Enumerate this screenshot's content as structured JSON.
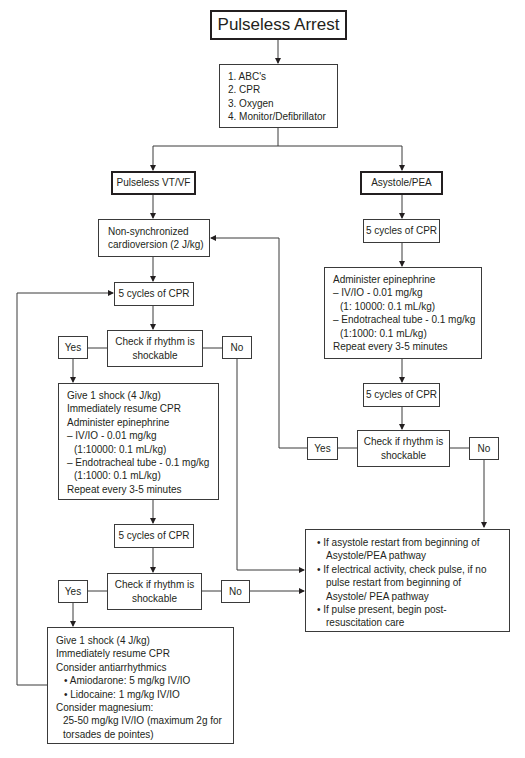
{
  "title": "Pulseless Arrest",
  "initial_steps": [
    "1. ABC's",
    "2. CPR",
    "3. Oxygen",
    "4. Monitor/Defibrillator"
  ],
  "branches": {
    "left": {
      "label": "Pulseless VT/VF",
      "cardioversion": [
        "Non-synchronized",
        "cardioversion (2 J/kg)"
      ],
      "cpr1": "5 cycles of CPR",
      "check1": [
        "Check if rhythm is",
        "shockable"
      ],
      "yes1": "Yes",
      "no1": "No",
      "shock1": {
        "lines": [
          "Give 1 shock (4 J/kg)",
          "Immediately resume CPR",
          "Administer epinephrine",
          "– IV/IO - 0.01 mg/kg",
          "(1:10000: 0.1 mL/kg)",
          "– Endotracheal tube - 0.1 mg/kg",
          "(1:1000: 0.1 mL/kg)",
          "Repeat every 3-5 minutes"
        ]
      },
      "cpr2": "5 cycles of CPR",
      "check2": [
        "Check if rhythm is",
        "shockable"
      ],
      "yes2": "Yes",
      "no2": "No",
      "shock2": {
        "lines": [
          "Give 1 shock (4 J/kg)",
          "Immediately resume CPR",
          "Consider antiarrhythmics",
          "• Amiodarone: 5 mg/kg IV/IO",
          "• Lidocaine: 1 mg/kg IV/IO",
          "Consider magnesium:",
          "25-50 mg/kg IV/IO (maximum 2g for",
          "torsades de pointes)"
        ]
      }
    },
    "right": {
      "label": "Asystole/PEA",
      "cpr1": "5 cycles of CPR",
      "epi": {
        "lines": [
          "Administer epinephrine",
          "– IV/IO - 0.01 mg/kg",
          "(1: 10000: 0.1 mL/kg)",
          "– Endotracheal tube - 0.1 mg/kg",
          "(1:1000: 0.1 mL/kg)",
          "Repeat every 3-5 minutes"
        ]
      },
      "cpr2": "5 cycles of CPR",
      "check": [
        "Check if rhythm is",
        "shockable"
      ],
      "yes": "Yes",
      "no": "No"
    }
  },
  "outcome": [
    "If asystole restart from beginning of Asystole/PEA pathway",
    "If electrical activity, check pulse, if no pulse restart from beginning of Asystole/ PEA pathway",
    "If pulse present, begin post-resuscitation care"
  ]
}
